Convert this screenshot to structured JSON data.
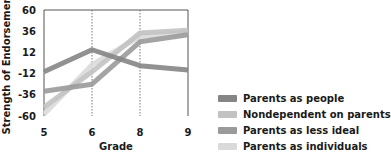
{
  "chart_data": {
    "type": "line",
    "title": "",
    "xlabel": "Grade",
    "ylabel": "Strength of Endorsement",
    "categories": [
      "5",
      "6",
      "8",
      "9"
    ],
    "yticks": [
      60,
      36,
      12,
      -12,
      -36,
      -60
    ],
    "ylim": [
      -60,
      60
    ],
    "grid": "vertical dotted lines at grades 6 and 8",
    "legend_position": "lower right, outside plot",
    "series": [
      {
        "name": "Parents as people",
        "color": "#858585",
        "values": [
          -10,
          15,
          -3,
          -8
        ]
      },
      {
        "name": "Nondependent on parents",
        "color": "#c2c2c2",
        "values": [
          -50,
          -10,
          34,
          37
        ]
      },
      {
        "name": "Parents as less ideal",
        "color": "#9a9a9a",
        "values": [
          -32,
          -24,
          24,
          32
        ]
      },
      {
        "name": "Parents as individuals",
        "color": "#dadada",
        "values": [
          -58,
          -2,
          30,
          35
        ]
      }
    ]
  },
  "legend": {
    "items": [
      {
        "label": "Parents as people",
        "color": "#858585"
      },
      {
        "label": "Nondependent on parents",
        "color": "#c2c2c2"
      },
      {
        "label": "Parents as less ideal",
        "color": "#9a9a9a"
      },
      {
        "label": "Parents as individuals",
        "color": "#dadada"
      }
    ]
  }
}
